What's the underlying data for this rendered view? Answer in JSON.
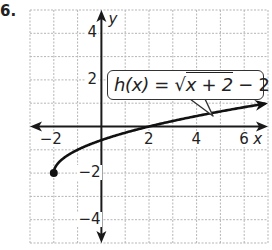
{
  "item_number": "6.",
  "chart_data": {
    "type": "line",
    "title": "",
    "function_label": "h(x) = √(x + 2) − 2",
    "function_label_parts": {
      "lhs": "h(x) = ",
      "radicand": "x + 2",
      "tail": " − 2"
    },
    "xlabel": "x",
    "ylabel": "y",
    "xlim": [
      -3,
      7
    ],
    "ylim": [
      -5,
      5
    ],
    "grid": true,
    "grid_step": 1,
    "x_ticks": [
      -2,
      2,
      4,
      6
    ],
    "x_tick_labels": [
      "−2",
      "2",
      "4",
      "6"
    ],
    "y_ticks": [
      4,
      2,
      -2,
      -4
    ],
    "y_tick_labels": [
      "4",
      "2",
      "−2",
      "−4"
    ],
    "series": [
      {
        "name": "h(x) = sqrt(x+2) - 2",
        "x": [
          -2,
          -1.75,
          -1.5,
          -1,
          0,
          1,
          2,
          3,
          4,
          5,
          6,
          7
        ],
        "values": [
          -2,
          -1.5,
          -1.29,
          -1,
          -0.59,
          -0.27,
          0,
          0.24,
          0.45,
          0.65,
          0.83,
          1.0
        ],
        "start_point": {
          "x": -2,
          "y": -2,
          "closed": true
        },
        "end_arrow": true
      }
    ]
  },
  "colors": {
    "grid": "#b5b5b5",
    "axis": "#1a1a1a",
    "curve": "#111111",
    "text": "#222222"
  }
}
